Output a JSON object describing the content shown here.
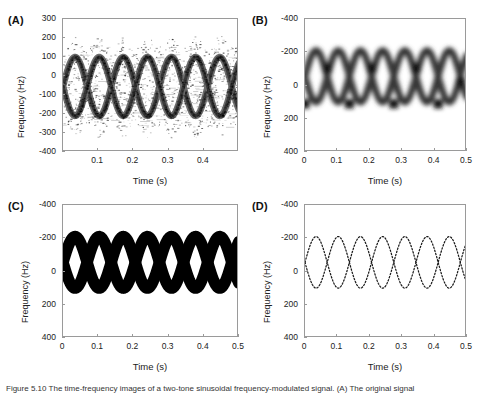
{
  "figure": {
    "caption": "Figure 5.10 The time-frequency images of a two-tone sinusoidal frequency-modulated signal. (A) The original signal"
  },
  "panels": [
    {
      "id": "A",
      "label": "(A)",
      "ylabel": "Frequency (Hz)",
      "xlabel": "Time (s)",
      "yticks": [
        "300",
        "200",
        "100",
        "0",
        "-100",
        "-200",
        "-300",
        "-400"
      ],
      "ytick_values": [
        300,
        200,
        100,
        0,
        -100,
        -200,
        -300,
        -400
      ],
      "xticks": [
        "0.1",
        "0.2",
        "0.3",
        "0.4"
      ],
      "xtick_values": [
        0.1,
        0.2,
        0.3,
        0.4
      ],
      "style": "noisy-interference"
    },
    {
      "id": "B",
      "label": "(B)",
      "ylabel": "Frequency (Hz)",
      "xlabel": "Time (s)",
      "yticks": [
        "-400",
        "-200",
        "0",
        "200",
        "400"
      ],
      "ytick_values": [
        -400,
        -200,
        0,
        200,
        400
      ],
      "xticks": [
        "0",
        "0.1",
        "0.2",
        "0.3",
        "0.4",
        "0.5"
      ],
      "xtick_values": [
        0,
        0.1,
        0.2,
        0.3,
        0.4,
        0.5
      ],
      "style": "smoothed-grayscale"
    },
    {
      "id": "C",
      "label": "(C)",
      "ylabel": "Frequency (Hz)",
      "xlabel": "Time (s)",
      "yticks": [
        "-400",
        "-200",
        "0",
        "200",
        "400"
      ],
      "ytick_values": [
        -400,
        -200,
        0,
        200,
        400
      ],
      "xticks": [
        "0",
        "0.1",
        "0.2",
        "0.3",
        "0.4",
        "0.5"
      ],
      "xtick_values": [
        0,
        0.1,
        0.2,
        0.3,
        0.4,
        0.5
      ],
      "style": "binary-thresholded"
    },
    {
      "id": "D",
      "label": "(D)",
      "ylabel": "Frequency (Hz)",
      "xlabel": "Time (s)",
      "yticks": [
        "-400",
        "-200",
        "0",
        "200",
        "400"
      ],
      "ytick_values": [
        -400,
        -200,
        0,
        200,
        400
      ],
      "xticks": [
        "0",
        "0.1",
        "0.2",
        "0.3",
        "0.4",
        "0.5"
      ],
      "xtick_values": [
        0,
        0.1,
        0.2,
        0.3,
        0.4,
        0.5
      ],
      "style": "thin-ridge-dotted"
    }
  ],
  "chart_data": [
    {
      "type": "line",
      "panel": "A",
      "title": "(A)",
      "xlabel": "Time (s)",
      "ylabel": "Frequency (Hz)",
      "xlim": [
        0,
        0.5
      ],
      "ylim": [
        -400,
        300
      ],
      "y_axis_direction": "descending",
      "grid": false,
      "legend": "none",
      "notes": "Wigner-Ville style distribution with heavy cross-term interference speckle",
      "series": [
        {
          "name": "ridge-1",
          "amplitude": 155,
          "offset": -55,
          "period": 0.137,
          "phase_deg": -90,
          "x": [
            0,
            0.034,
            0.069,
            0.103,
            0.137,
            0.171,
            0.206,
            0.24,
            0.274,
            0.309,
            0.343,
            0.377,
            0.411,
            0.446,
            0.48,
            0.5
          ],
          "values": [
            -210,
            -140,
            -55,
            30,
            100,
            30,
            -55,
            -140,
            -210,
            -140,
            -55,
            30,
            100,
            30,
            -90,
            -175
          ]
        },
        {
          "name": "ridge-2",
          "amplitude": 155,
          "offset": -55,
          "period": 0.137,
          "phase_deg": 90,
          "x": [
            0,
            0.034,
            0.069,
            0.103,
            0.137,
            0.171,
            0.206,
            0.24,
            0.274,
            0.309,
            0.343,
            0.377,
            0.411,
            0.446,
            0.48,
            0.5
          ],
          "values": [
            100,
            30,
            -55,
            -140,
            -210,
            -140,
            -55,
            30,
            100,
            30,
            -55,
            -140,
            -210,
            -140,
            -20,
            65
          ]
        }
      ]
    },
    {
      "type": "line",
      "panel": "B",
      "title": "(B)",
      "xlabel": "Time (s)",
      "ylabel": "Frequency (Hz)",
      "xlim": [
        0,
        0.5
      ],
      "ylim": [
        -400,
        400
      ],
      "y_axis_direction": "inverted",
      "grid": false,
      "legend": "none",
      "notes": "Smoothed pseudo Wigner-Ville distribution, grayscale blur, dark crossing nodes",
      "series": [
        {
          "name": "ridge-1",
          "amplitude": 155,
          "offset": -55,
          "period": 0.137,
          "phase_deg": -90,
          "x": [
            0,
            0.034,
            0.069,
            0.103,
            0.137,
            0.171,
            0.206,
            0.24,
            0.274,
            0.309,
            0.343,
            0.377,
            0.411,
            0.446,
            0.48,
            0.5
          ],
          "values": [
            -210,
            -140,
            -55,
            30,
            100,
            30,
            -55,
            -140,
            -210,
            -140,
            -55,
            30,
            100,
            30,
            -90,
            -175
          ]
        },
        {
          "name": "ridge-2",
          "amplitude": 155,
          "offset": -55,
          "period": 0.137,
          "phase_deg": 90,
          "x": [
            0,
            0.034,
            0.069,
            0.103,
            0.137,
            0.171,
            0.206,
            0.24,
            0.274,
            0.309,
            0.343,
            0.377,
            0.411,
            0.446,
            0.48,
            0.5
          ],
          "values": [
            100,
            30,
            -55,
            -140,
            -210,
            -140,
            -55,
            30,
            100,
            30,
            -55,
            -140,
            -210,
            -140,
            -20,
            65
          ]
        }
      ],
      "crossing_nodes": [
        {
          "t": 0.069,
          "f": -105
        },
        {
          "t": 0.137,
          "f": 110
        },
        {
          "t": 0.206,
          "f": -105
        },
        {
          "t": 0.274,
          "f": 110
        },
        {
          "t": 0.343,
          "f": -105
        },
        {
          "t": 0.411,
          "f": 110
        },
        {
          "t": 0.0,
          "f": 110
        },
        {
          "t": 0.48,
          "f": -20
        }
      ]
    },
    {
      "type": "line",
      "panel": "C",
      "title": "(C)",
      "xlabel": "Time (s)",
      "ylabel": "Frequency (Hz)",
      "xlim": [
        0,
        0.5
      ],
      "ylim": [
        -400,
        400
      ],
      "y_axis_direction": "inverted",
      "grid": false,
      "legend": "none",
      "notes": "Binary thresholded mask, very thick solid black bands",
      "series": [
        {
          "name": "ridge-1",
          "amplitude": 155,
          "offset": -55,
          "period": 0.137,
          "phase_deg": -90,
          "x": [
            0,
            0.034,
            0.069,
            0.103,
            0.137,
            0.171,
            0.206,
            0.24,
            0.274,
            0.309,
            0.343,
            0.377,
            0.411,
            0.446,
            0.48,
            0.5
          ],
          "values": [
            -210,
            -140,
            -55,
            30,
            100,
            30,
            -55,
            -140,
            -210,
            -140,
            -55,
            30,
            100,
            30,
            -90,
            -175
          ]
        },
        {
          "name": "ridge-2",
          "amplitude": 155,
          "offset": -55,
          "period": 0.137,
          "phase_deg": 90,
          "x": [
            0,
            0.034,
            0.069,
            0.103,
            0.137,
            0.171,
            0.206,
            0.24,
            0.274,
            0.309,
            0.343,
            0.377,
            0.411,
            0.446,
            0.48,
            0.5
          ],
          "values": [
            100,
            30,
            -55,
            -140,
            -210,
            -140,
            -55,
            30,
            100,
            30,
            -55,
            -140,
            -210,
            -140,
            -20,
            65
          ]
        }
      ]
    },
    {
      "type": "scatter",
      "panel": "D",
      "title": "(D)",
      "xlabel": "Time (s)",
      "ylabel": "Frequency (Hz)",
      "xlim": [
        0,
        0.5
      ],
      "ylim": [
        -400,
        400
      ],
      "y_axis_direction": "inverted",
      "grid": false,
      "legend": "none",
      "notes": "Extracted instantaneous frequency ridges, thin dotted traces",
      "series": [
        {
          "name": "ridge-1",
          "amplitude": 155,
          "offset": -55,
          "period": 0.137,
          "phase_deg": -90,
          "x": [
            0,
            0.034,
            0.069,
            0.103,
            0.137,
            0.171,
            0.206,
            0.24,
            0.274,
            0.309,
            0.343,
            0.377,
            0.411,
            0.446,
            0.48,
            0.5
          ],
          "values": [
            -210,
            -140,
            -55,
            30,
            100,
            30,
            -55,
            -140,
            -210,
            -140,
            -55,
            30,
            100,
            30,
            -90,
            -175
          ]
        },
        {
          "name": "ridge-2",
          "amplitude": 155,
          "offset": -55,
          "period": 0.137,
          "phase_deg": 90,
          "x": [
            0,
            0.034,
            0.069,
            0.103,
            0.137,
            0.171,
            0.206,
            0.24,
            0.274,
            0.309,
            0.343,
            0.377,
            0.411,
            0.446,
            0.48,
            0.5
          ],
          "values": [
            100,
            30,
            -55,
            -140,
            -210,
            -140,
            -55,
            30,
            100,
            30,
            -55,
            -140,
            -210,
            -140,
            -20,
            65
          ]
        }
      ]
    }
  ],
  "colors": {
    "axis": "#9a9a9a",
    "text": "#222222",
    "ink": "#000000",
    "background": "#ffffff"
  }
}
